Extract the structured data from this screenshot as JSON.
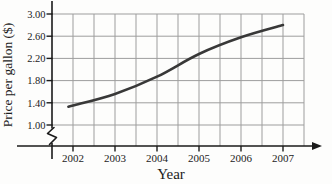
{
  "chart_data": {
    "type": "line",
    "title": "",
    "xlabel": "Year",
    "ylabel": "Price per gallon ($)",
    "x": [
      2002,
      2003,
      2004,
      2005,
      2006,
      2007
    ],
    "series": [
      {
        "name": "price-per-gallon",
        "values": [
          1.35,
          1.56,
          1.87,
          2.28,
          2.58,
          2.8
        ]
      }
    ],
    "xtick_labels": [
      "2002",
      "2003",
      "2004",
      "2005",
      "2006",
      "2007"
    ],
    "ytick_labels": [
      "1.00",
      "1.40",
      "1.80",
      "2.20",
      "2.60",
      "3.00"
    ],
    "yticks": [
      1.0,
      1.4,
      1.8,
      2.2,
      2.6,
      3.0
    ],
    "ylim": [
      1.0,
      3.0
    ],
    "xlim": [
      2002,
      2007.5
    ],
    "x_minor_grid_step_years": 0.5,
    "grid": "on",
    "legend": "none",
    "axis_break": "y-axis break below 1.00",
    "colors": {
      "line": "#383838",
      "grid": "#9d9d9d",
      "axis": "#1a1a1a",
      "text": "#1b1b1b",
      "background": "#fdfdfc"
    }
  }
}
